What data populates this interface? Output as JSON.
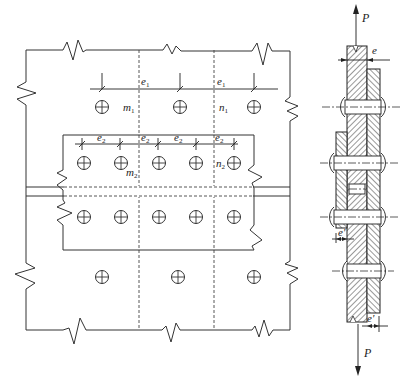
{
  "diagram": {
    "plan_view": {
      "labels": {
        "e1_left": "e",
        "e1_left_sub": "1",
        "e1_right": "e",
        "e1_right_sub": "1",
        "m1": "m",
        "m1_sub": "1",
        "n1": "n",
        "n1_sub": "1",
        "m2": "m",
        "m2_sub": "2",
        "n2": "n",
        "n2_sub": "2",
        "e2_labels": [
          {
            "text": "e",
            "sub": "2"
          },
          {
            "text": "e",
            "sub": "2"
          },
          {
            "text": "e",
            "sub": "2"
          },
          {
            "text": "e",
            "sub": "2"
          }
        ]
      },
      "bolt_rows": {
        "top_row_count": 3,
        "cover_upper_row_count": 5,
        "cover_lower_row_count": 5,
        "bottom_row_count": 3
      }
    },
    "section_view": {
      "labels": {
        "load_top": "P",
        "load_bottom": "P",
        "e_top": "e",
        "e_prime_mid": "e'",
        "e_prime_bottom": "e'"
      }
    }
  }
}
